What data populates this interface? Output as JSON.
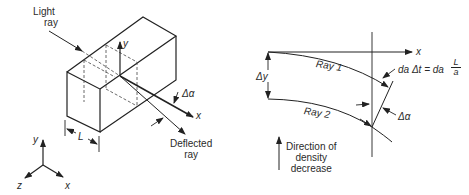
{
  "left_figure": {
    "light_ray_label": [
      "Light",
      "ray"
    ],
    "deflected_ray_label": [
      "Deflected",
      "ray"
    ],
    "delta_alpha_label": "Δα",
    "box_axis_y": "y",
    "box_axis_x": "x",
    "length_label": "L",
    "triad": {
      "y": "y",
      "z": "z",
      "x": "x"
    }
  },
  "right_figure": {
    "axis_x": "x",
    "delta_y_label": "Δy",
    "ray1_label": "Ray 1",
    "ray2_label": "Ray 2",
    "equation": {
      "lhs": "da  Δt = da",
      "frac_num": "L",
      "frac_den": "a"
    },
    "delta_alpha_label": "Δα",
    "density_label": [
      "Direction of",
      "density",
      "decrease"
    ]
  },
  "colors": {
    "line": "#222222",
    "background": "#ffffff"
  }
}
